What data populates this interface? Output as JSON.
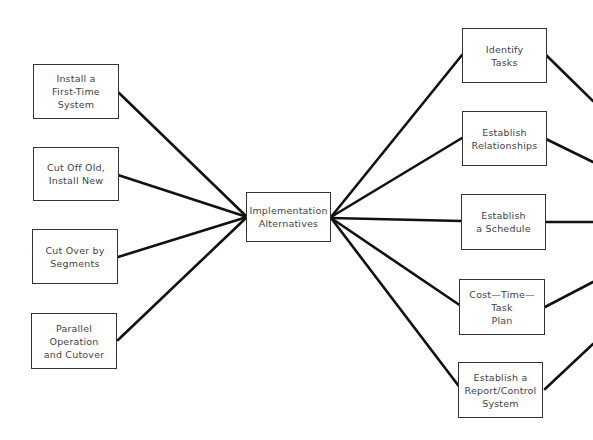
{
  "diagram": {
    "center": {
      "label": "Implementation\nAlternatives"
    },
    "left_nodes": [
      {
        "label": "Install a\nFirst-Time\nSystem"
      },
      {
        "label": "Cut Off Old,\nInstall New"
      },
      {
        "label": "Cut Over by\nSegments"
      },
      {
        "label": "Parallel\nOperation\nand Cutover"
      }
    ],
    "right_nodes": [
      {
        "label": "Identify\nTasks"
      },
      {
        "label": "Establish\nRelationships"
      },
      {
        "label": "Establish\na Schedule"
      },
      {
        "label": "Cost—Time—Task\nPlan"
      },
      {
        "label": "Establish a\nReport/Control\nSystem"
      }
    ],
    "line_color": "#111111"
  }
}
